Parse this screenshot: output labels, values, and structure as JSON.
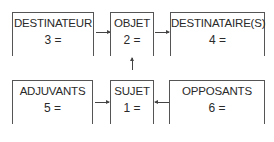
{
  "diagram": {
    "type": "actantial-model",
    "top_row": [
      {
        "id": "destinateur",
        "label": "DESTINATEUR",
        "value": "3 ="
      },
      {
        "id": "objet",
        "label": "OBJET",
        "value": "2 ="
      },
      {
        "id": "destinataires",
        "label": "DESTINATAIRE(S)",
        "value": "4 ="
      }
    ],
    "bottom_row": [
      {
        "id": "adjuvants",
        "label": "ADJUVANTS",
        "value": "5 ="
      },
      {
        "id": "sujet",
        "label": "SUJET",
        "value": "1 ="
      },
      {
        "id": "opposants",
        "label": "OPPOSANTS",
        "value": "6 ="
      }
    ],
    "arrows": [
      {
        "from": "destinateur",
        "to": "objet",
        "direction": "right"
      },
      {
        "from": "objet",
        "to": "destinataires",
        "direction": "right"
      },
      {
        "from": "sujet",
        "to": "objet",
        "direction": "up"
      },
      {
        "from": "adjuvants",
        "to": "sujet",
        "direction": "right"
      },
      {
        "from": "opposants",
        "to": "sujet",
        "direction": "left"
      }
    ]
  }
}
